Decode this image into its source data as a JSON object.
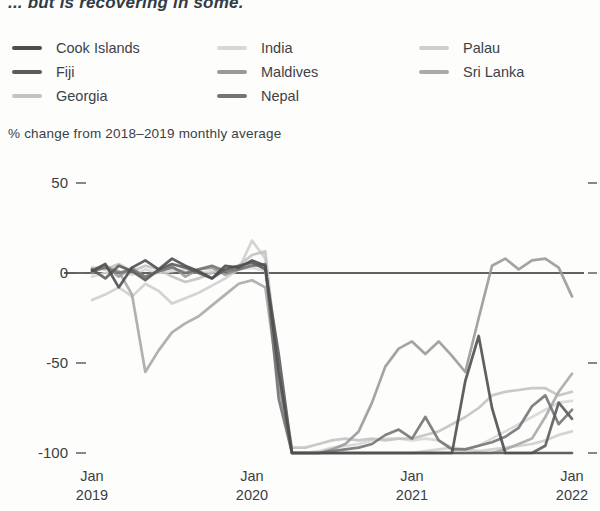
{
  "page": {
    "title": "... but is recovering in some."
  },
  "legend": {
    "items": [
      {
        "label": "Cook Islands",
        "color": "#4f4f4f"
      },
      {
        "label": "Fiji",
        "color": "#5c5c5c"
      },
      {
        "label": "Georgia",
        "color": "#c3c3c3"
      },
      {
        "label": "India",
        "color": "#d7d7d7"
      },
      {
        "label": "Maldives",
        "color": "#9a9a9a"
      },
      {
        "label": "Nepal",
        "color": "#747474"
      },
      {
        "label": "Palau",
        "color": "#cfcfcf"
      },
      {
        "label": "Sri Lanka",
        "color": "#a9a9a9"
      }
    ]
  },
  "chart_data": {
    "type": "line",
    "title": "... but is recovering in some.",
    "ylabel": "% change from 2018–2019 monthly average",
    "x_unit": "month",
    "x_range": [
      "Jan 2019",
      "Jan 2022"
    ],
    "n_points": 37,
    "x_tick_months": [
      0,
      12,
      24,
      36
    ],
    "x_tick_labels": [
      {
        "top": "Jan",
        "bottom": "2019"
      },
      {
        "top": "Jan",
        "bottom": "2020"
      },
      {
        "top": "Jan",
        "bottom": "2021"
      },
      {
        "top": "Jan",
        "bottom": "2022"
      }
    ],
    "y_ticks": [
      50,
      0,
      -50,
      -100
    ],
    "ylim": [
      -110,
      55
    ],
    "grid": false,
    "legend_position": "top",
    "zero_line": true,
    "series": [
      {
        "name": "India",
        "color": "#d7d7d7",
        "values": [
          -2,
          0,
          1,
          -1,
          2,
          0,
          1,
          2,
          0,
          1,
          3,
          2,
          3,
          1,
          -65,
          -100,
          -100,
          -99,
          -97,
          -96,
          -95,
          -93,
          -92,
          -92,
          -93,
          -92,
          -93,
          -97,
          -98,
          -96,
          -92,
          -88,
          -84,
          -80,
          -76,
          -72,
          -71
        ]
      },
      {
        "name": "Palau",
        "color": "#cfcfcf",
        "values": [
          -15,
          -12,
          -8,
          -13,
          -6,
          -10,
          -17,
          -14,
          -11,
          -7,
          -3,
          2,
          18,
          8,
          -58,
          -100,
          -100,
          -100,
          -100,
          -100,
          -100,
          -100,
          -100,
          -100,
          -100,
          -99,
          -98,
          -97,
          -98,
          -99,
          -98,
          -97,
          -96,
          -95,
          -93,
          -90,
          -88
        ]
      },
      {
        "name": "Georgia",
        "color": "#c3c3c3",
        "values": [
          3,
          2,
          5,
          1,
          4,
          2,
          -2,
          -5,
          -3,
          0,
          2,
          4,
          10,
          12,
          -55,
          -97,
          -97,
          -95,
          -93,
          -92,
          -93,
          -92,
          -93,
          -92,
          -92,
          -90,
          -88,
          -84,
          -80,
          -75,
          -68,
          -66,
          -65,
          -64,
          -64,
          -68,
          -66
        ]
      },
      {
        "name": "Sri Lanka",
        "color": "#a9a9a9",
        "values": [
          2,
          4,
          1,
          -12,
          -55,
          -43,
          -33,
          -28,
          -24,
          -18,
          -12,
          -6,
          -4,
          -8,
          -62,
          -100,
          -100,
          -100,
          -100,
          -100,
          -100,
          -100,
          -100,
          -100,
          -100,
          -100,
          -100,
          -100,
          -100,
          -100,
          -100,
          -98,
          -95,
          -92,
          -80,
          -66,
          -56
        ]
      },
      {
        "name": "Maldives",
        "color": "#9a9a9a",
        "values": [
          0,
          4,
          -2,
          3,
          -3,
          1,
          4,
          -2,
          2,
          3,
          -1,
          2,
          5,
          3,
          -60,
          -100,
          -100,
          -100,
          -98,
          -95,
          -88,
          -72,
          -52,
          -42,
          -38,
          -45,
          -38,
          -46,
          -55,
          -25,
          4,
          8,
          2,
          7,
          8,
          3,
          -13
        ]
      },
      {
        "name": "Nepal",
        "color": "#747474",
        "values": [
          1,
          3,
          0,
          2,
          -2,
          1,
          3,
          0,
          2,
          4,
          1,
          2,
          4,
          5,
          -70,
          -100,
          -100,
          -100,
          -99,
          -98,
          -97,
          -95,
          -90,
          -87,
          -92,
          -80,
          -93,
          -98,
          -98,
          -96,
          -94,
          -91,
          -86,
          -74,
          -68,
          -84,
          -76
        ]
      },
      {
        "name": "Fiji",
        "color": "#5c5c5c",
        "values": [
          2,
          -3,
          4,
          1,
          -4,
          2,
          5,
          3,
          0,
          -3,
          2,
          4,
          6,
          2,
          -45,
          -100,
          -100,
          -100,
          -100,
          -100,
          -100,
          -100,
          -100,
          -100,
          -100,
          -100,
          -100,
          -100,
          -100,
          -100,
          -100,
          -100,
          -100,
          -100,
          -96,
          -72,
          -81
        ]
      },
      {
        "name": "Cook Islands",
        "color": "#4f4f4f",
        "values": [
          1,
          5,
          -8,
          3,
          7,
          2,
          8,
          4,
          1,
          -3,
          4,
          3,
          7,
          4,
          -55,
          -100,
          -100,
          -100,
          -100,
          -100,
          -100,
          -100,
          -100,
          -100,
          -100,
          -100,
          -100,
          -100,
          -60,
          -35,
          -75,
          -100,
          -100,
          -100,
          -100,
          -100,
          -100
        ]
      }
    ]
  }
}
